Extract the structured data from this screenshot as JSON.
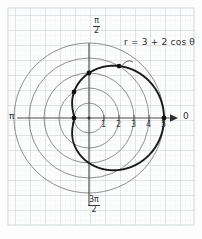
{
  "chart_data": {
    "type": "line",
    "subtype": "polar",
    "title": "",
    "curve_label": "r = 3 + 2 cos θ",
    "equation": {
      "r_symbol": "r",
      "equals": "=",
      "constant": 3,
      "amplitude": 2,
      "trig": "cos",
      "angle_symbol": "θ"
    },
    "polar_axis_labels": {
      "right": "0",
      "left": "π",
      "top_numerator": "π",
      "top_denominator": "2",
      "bottom_numerator": "3π",
      "bottom_denominator": "2"
    },
    "radial_ticks": [
      "1",
      "2",
      "3",
      "4",
      "5"
    ],
    "radial_tick_values": [
      1,
      2,
      3,
      4,
      5
    ],
    "rlim": [
      0,
      5
    ],
    "grid_circles": [
      1,
      2,
      3,
      4,
      5
    ],
    "grid": "polar-graph-paper",
    "legend": "none",
    "marked_points": [
      {
        "theta_deg": 0,
        "r": 5,
        "label": ""
      },
      {
        "theta_deg": 60,
        "r": 4,
        "label": ""
      },
      {
        "theta_deg": 90,
        "r": 3,
        "label": ""
      },
      {
        "theta_deg": 120,
        "r": 2,
        "label": ""
      },
      {
        "theta_deg": 180,
        "r": 1,
        "label": ""
      }
    ],
    "series": [
      {
        "name": "r = 3 + 2 cos θ",
        "kind": "limacon",
        "color": "#1a1a1a",
        "theta_range_deg": [
          0,
          360
        ],
        "r_of_theta": "3 + 2*cos(theta)",
        "r_max": 5,
        "r_min": 1
      }
    ],
    "xlabel": "",
    "ylabel": ""
  },
  "figure": {
    "alt": "Polar graph of the limacon r = 3 + 2 cos theta on polar graph paper",
    "paper_color": "#fdfdfd",
    "grid_color": "#d9dde0",
    "circle_color": "#6f6f6f",
    "axis_color": "#4a4a4a",
    "curve_color": "#141414"
  }
}
